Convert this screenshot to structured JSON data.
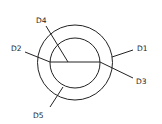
{
  "diagram": {
    "labels": {
      "d1": "D1",
      "d2": "D2",
      "d3": "D3",
      "d4": "D4",
      "d5": "D5"
    },
    "colors": {
      "stroke": "#222222",
      "background": "#ffffff"
    }
  }
}
